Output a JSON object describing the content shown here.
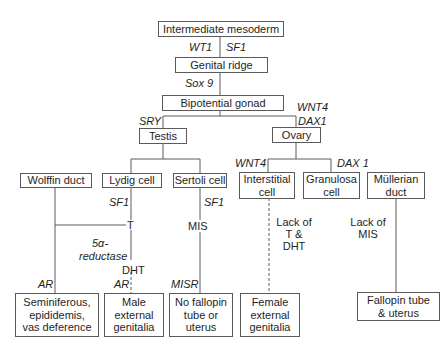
{
  "diagram": {
    "nodes": {
      "intermediate_mesoderm": "Intermediate mesoderm",
      "genital_ridge": "Genital ridge",
      "bipotential_gonad": "Bipotential gonad",
      "testis": "Testis",
      "ovary": "Ovary",
      "wolffin_duct": "Wolffin duct",
      "lydig_cell": "Lydig cell",
      "sertoli_cell": "Sertoli cell",
      "interstitial_cell": "Interstitial\ncell",
      "granulosa_cell": "Granulosa\ncell",
      "mullerian_duct": "Müllerian\nduct",
      "seminiferous": "Seminiferous,\nepididemis,\nvas deference",
      "male_external_genitalia": "Male\nexternal\ngenitalia",
      "no_fallopin": "No fallopin\ntube or\nuterus",
      "female_external_genitalia": "Female\nexternal\ngenitalia",
      "fallopin_tube_uterus": "Fallopin tube\n& uterus"
    },
    "labels": {
      "wt1": "WT1",
      "sf1_top": "SF1",
      "sox9": "Sox 9",
      "sry": "SRY",
      "wnt4_ovary": "WNT4",
      "dax1_ovary": "DAX1",
      "wnt4_interstitial": "WNT4",
      "dax1_granulosa": "DAX 1",
      "sf1_lydig": "SF1",
      "sf1_sertoli": "SF1",
      "t": "T",
      "five_alpha": "5α-",
      "reductase": "reductase",
      "dht": "DHT",
      "mis": "MIS",
      "ar_wolffin": "AR",
      "ar_lydig": "AR",
      "misr": "MISR",
      "lack_t_dht": "Lack of\nT & DHT",
      "lack_mis": "Lack of\nMIS"
    },
    "colors": {
      "line": "#5a5a5a",
      "text": "#1e1e1e",
      "background": "#ffffff"
    }
  }
}
